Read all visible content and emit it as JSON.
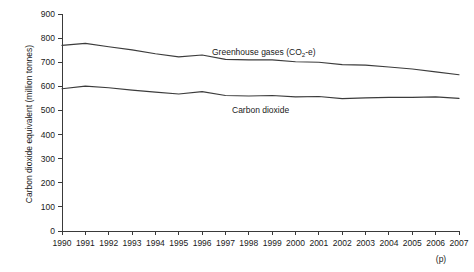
{
  "chart_data": {
    "type": "line",
    "title": "",
    "subtitle": "",
    "xlabel": "",
    "ylabel": "Carbon dioxide equivalent (million tonnes)",
    "xlim": [
      1990,
      2007
    ],
    "ylim": [
      0,
      900
    ],
    "y_ticks": [
      0,
      100,
      200,
      300,
      400,
      500,
      600,
      700,
      800,
      900
    ],
    "grid": false,
    "legend_position": "inline-annotation",
    "x": [
      1990,
      1991,
      1992,
      1993,
      1994,
      1995,
      1996,
      1997,
      1998,
      1999,
      2000,
      2001,
      2002,
      2003,
      2004,
      2005,
      2006,
      2007
    ],
    "categories": [
      "1990",
      "1991",
      "1992",
      "1993",
      "1994",
      "1995",
      "1996",
      "1997",
      "1998",
      "1999",
      "2000",
      "2001",
      "2002",
      "2003",
      "2004",
      "2005",
      "2006",
      "2007"
    ],
    "series": [
      {
        "name": "Greenhouse gases (CO2-e)",
        "label_main": "Greenhouse gases (CO",
        "label_sub": "2",
        "label_tail": "-e)",
        "color": "#3c3c3c",
        "values": [
          770,
          778,
          764,
          751,
          735,
          722,
          730,
          712,
          710,
          710,
          702,
          700,
          690,
          688,
          680,
          672,
          660,
          648
        ]
      },
      {
        "name": "Carbon dioxide",
        "label_main": "Carbon dioxide",
        "color": "#3c3c3c",
        "values": [
          590,
          601,
          594,
          584,
          576,
          568,
          578,
          562,
          560,
          562,
          556,
          558,
          549,
          552,
          554,
          554,
          556,
          550
        ]
      }
    ],
    "annotations": [
      {
        "id": "ghg-label",
        "text": "Greenhouse gases (CO2-e)",
        "x": 1998.2,
        "y": 752
      },
      {
        "id": "co2-label",
        "text": "Carbon dioxide",
        "x": 1998.4,
        "y": 522
      }
    ],
    "footnote": "(p)",
    "footnote_meaning": "provisional"
  },
  "axes": {
    "y_title": "Carbon dioxide equivalent (million tonnes)",
    "y_tick_labels": [
      "900",
      "800",
      "700",
      "600",
      "500",
      "400",
      "300",
      "200",
      "100",
      "0"
    ],
    "x_tick_labels": [
      "1990",
      "1991",
      "1992",
      "1993",
      "1994",
      "1995",
      "1996",
      "1997",
      "1998",
      "1999",
      "2000",
      "2001",
      "2002",
      "2003",
      "2004",
      "2005",
      "2006",
      "2007"
    ],
    "provisional_marker": "(p)"
  },
  "labels": {
    "greenhouse_main": "Greenhouse gases (CO",
    "greenhouse_sub": "2",
    "greenhouse_tail": "-e)",
    "carbon_dioxide": "Carbon dioxide"
  },
  "colors": {
    "line": "#3c3c3c",
    "axis": "#3a3a3a",
    "text": "#1a1a1a",
    "background": "#ffffff"
  }
}
